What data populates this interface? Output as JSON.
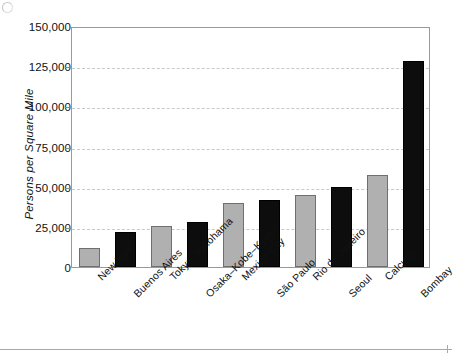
{
  "chart_data": {
    "type": "bar",
    "title": "",
    "xlabel": "",
    "ylabel": "Persons per Square Mile",
    "ylim": [
      0,
      150000
    ],
    "grid": true,
    "legend": "none",
    "categories": [
      "New York",
      "Buenos Aires",
      "Tokyo–Yokohama",
      "Osaka–Kobe–Kyoto",
      "Mexico City",
      "São Paulo",
      "Rio de Janeiro",
      "Seoul",
      "Calcutta",
      "Bombay"
    ],
    "values": [
      12000,
      22000,
      25500,
      28000,
      40000,
      42000,
      45000,
      50000,
      57000,
      128000
    ],
    "bar_colors": [
      "light",
      "dark",
      "light",
      "dark",
      "light",
      "dark",
      "light",
      "dark",
      "light",
      "dark"
    ],
    "yticks": [
      0,
      25000,
      50000,
      75000,
      100000,
      125000,
      150000
    ],
    "ytick_labels": [
      "0",
      "25,000",
      "50,000",
      "75,000",
      "100,000",
      "125,000",
      "150,000"
    ]
  },
  "colors": {
    "bar_light": "#b0b0b0",
    "bar_light_edge": "#6f6f6f",
    "bar_dark": "#0d0d0d",
    "gridline": "#c9c9c9",
    "frame": "#9a9a9a",
    "text": "#111111",
    "background": "#ffffff"
  }
}
